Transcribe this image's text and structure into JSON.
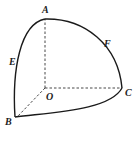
{
  "diagram": {
    "points": {
      "A": "A",
      "B": "B",
      "C": "C",
      "O": "O",
      "E": "E",
      "F": "F"
    },
    "solid_arcs": [
      "AEB",
      "AFC",
      "BC"
    ],
    "dashed_segments": [
      "OA",
      "OB",
      "OC"
    ],
    "colors": {
      "line": "#1a1a1a",
      "background": "#ffffff"
    }
  }
}
